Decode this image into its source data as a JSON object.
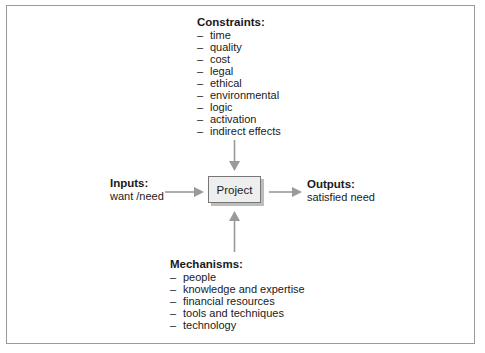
{
  "diagram": {
    "center": {
      "label": "Project"
    },
    "constraints": {
      "title": "Constraints:",
      "items": [
        "time",
        "quality",
        "cost",
        "legal",
        "ethical",
        "environmental",
        "logic",
        "activation",
        "indirect effects"
      ]
    },
    "inputs": {
      "title": "Inputs:",
      "value": "want /need"
    },
    "outputs": {
      "title": "Outputs:",
      "value": "satisfied need"
    },
    "mechanisms": {
      "title": "Mechanisms:",
      "items": [
        "people",
        "knowledge and expertise",
        "financial resources",
        "tools and techniques",
        "technology"
      ]
    },
    "bullet": "–",
    "colors": {
      "arrow": "#9a9a9a",
      "box_fill": "#eeeeee",
      "box_shadow": "#bdbdbd",
      "frame": "#9a9a9a"
    }
  }
}
